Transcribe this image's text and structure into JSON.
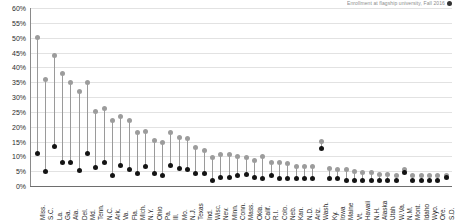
{
  "header": {
    "caption": "Enrollment at flagship university, Fall 2016",
    "legend_marker": "black-dot"
  },
  "chart_data": {
    "type": "scatter",
    "title": "",
    "subtitle": "",
    "xlabel": "",
    "ylabel": "",
    "ylim": [
      0,
      60
    ],
    "ytick_step": 5,
    "ytick_labels": [
      "0%",
      "5%",
      "10%",
      "15%",
      "20%",
      "25%",
      "30%",
      "35%",
      "40%",
      "45%",
      "50%",
      "55%",
      "60%"
    ],
    "grid": true,
    "legend_position": "top-right",
    "connector": "dumbbell",
    "series": [
      {
        "name": "Share of college-age population",
        "color": "#9c9c9c",
        "marker": "gray-dot",
        "values": [
          50,
          36,
          44,
          38,
          35,
          32,
          35,
          25,
          26,
          22,
          23.5,
          22,
          18,
          18.5,
          15.5,
          14.5,
          18,
          16.5,
          16,
          13,
          12,
          9.5,
          10.5,
          10.5,
          10,
          9.5,
          8.5,
          10,
          8,
          8,
          7.5,
          6.5,
          6.5,
          6.5,
          15,
          6,
          5.5,
          5.5,
          5,
          4.5,
          4.5,
          4,
          4,
          3.5,
          5.5,
          3.5,
          3.5,
          3.5,
          3.5,
          3.5
        ]
      },
      {
        "name": "Share of freshman enrollment",
        "color": "#141414",
        "marker": "black-dot",
        "values": [
          11,
          4.8,
          13.2,
          8,
          8,
          5.3,
          10.8,
          6.3,
          8,
          3.7,
          7,
          5.5,
          4.2,
          6.7,
          4.2,
          3.5,
          7,
          6,
          5.6,
          4.2,
          4.2,
          2,
          3,
          3,
          3.5,
          4,
          3,
          2.5,
          3.5,
          2.5,
          2.5,
          2.5,
          2.5,
          2.5,
          12.5,
          2.5,
          2.5,
          2,
          2,
          2,
          2,
          2,
          2,
          2,
          4.5,
          2,
          2,
          2,
          2,
          3
        ]
      }
    ],
    "categories": [
      "Miss.",
      "S.C.",
      "La.",
      "Ga.",
      "Ala.",
      "Del.",
      "Md.",
      "Tenn.",
      "N.C.",
      "Ark.",
      "Va.",
      "Fla.",
      "Mich.",
      "N.Y.",
      "Ohio",
      "Pa.",
      "Ill.",
      "Mo.",
      "N.J.",
      "Texas",
      "Ind.",
      "Wisc.",
      "Nev.",
      "Minn.",
      "Conn.",
      "Mass.",
      "Okla.",
      "Calif.",
      "R.I.",
      "Colo.",
      "Neb.",
      "Kan.",
      "N.D.",
      "Ariz.",
      "Wash.",
      "Ky.",
      "Iowa",
      "Maine",
      "Vt.",
      "Hawaii",
      "N.H.",
      "Alaska",
      "Utah",
      "W.Va.",
      "N.M.",
      "Mont.",
      "Idaho",
      "Wyo.",
      "Ore.",
      "S.D."
    ]
  }
}
